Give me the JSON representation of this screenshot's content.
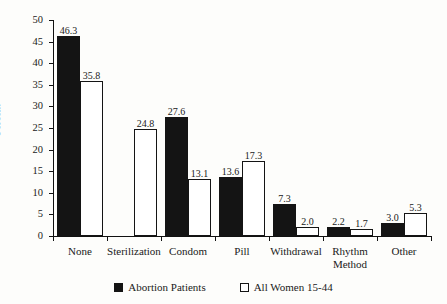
{
  "chart_data": {
    "type": "bar",
    "title": "",
    "xlabel": "",
    "ylabel": "Percent",
    "ylim": [
      0,
      50
    ],
    "ytick_step": 5,
    "yticks": [
      0,
      5,
      10,
      15,
      20,
      25,
      30,
      35,
      40,
      45,
      50
    ],
    "grid": false,
    "legend_position": "bottom",
    "categories": [
      "None",
      "Sterilization",
      "Condom",
      "Pill",
      "Withdrawal",
      "Rhythm\nMethod",
      "Other"
    ],
    "series": [
      {
        "name": "Abortion Patients",
        "color": "#141414",
        "style": "filled",
        "values": [
          46.3,
          null,
          27.6,
          13.6,
          7.3,
          2.2,
          3.0
        ],
        "labels": [
          "46.3",
          "",
          "27.6",
          "13.6",
          "7.3",
          "2.2",
          "3.0"
        ]
      },
      {
        "name": "All Women 15-44",
        "color": "#ffffff",
        "style": "outlined",
        "values": [
          35.8,
          24.8,
          13.1,
          17.3,
          2.0,
          1.7,
          5.3
        ],
        "labels": [
          "35.8",
          "24.8",
          "13.1",
          "17.3",
          "2.0",
          "1.7",
          "5.3"
        ]
      }
    ]
  },
  "legend": {
    "items": [
      {
        "label": "Abortion Patients",
        "swatch": "filled-square-icon"
      },
      {
        "label": "All Women 15-44",
        "swatch": "open-square-icon"
      }
    ]
  }
}
